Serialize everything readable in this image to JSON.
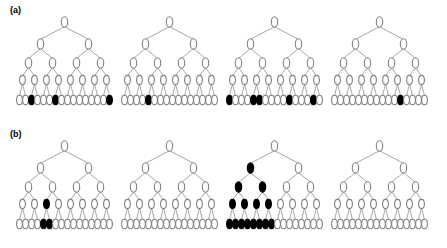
{
  "figure": {
    "title": "",
    "width": 447,
    "height": 248,
    "background": "#ffffff",
    "node_outline_color": "#808080",
    "node_fill_empty": "#ffffff",
    "node_fill_marked": "#000000",
    "edge_color": "#909090"
  },
  "panels": [
    {
      "label": "(a)",
      "id": "panel-a",
      "trees": [
        {
          "name": "tree-a-1",
          "levels": [
            1,
            2,
            4,
            8,
            16
          ],
          "marked": {
            "level0": [],
            "level1": [],
            "level2": [],
            "level3": [],
            "level4": [
              3,
              7,
              16
            ]
          }
        },
        {
          "name": "tree-a-2",
          "levels": [
            1,
            2,
            4,
            8,
            16
          ],
          "marked": {
            "level0": [],
            "level1": [],
            "level2": [],
            "level3": [],
            "level4": [
              5
            ]
          }
        },
        {
          "name": "tree-a-3",
          "levels": [
            1,
            2,
            4,
            8,
            16
          ],
          "marked": {
            "level0": [],
            "level1": [],
            "level2": [],
            "level3": [],
            "level4": [
              1,
              5,
              6,
              11,
              15
            ]
          }
        },
        {
          "name": "tree-a-4",
          "levels": [
            1,
            2,
            4,
            8,
            16
          ],
          "marked": {
            "level0": [],
            "level1": [],
            "level2": [],
            "level3": [],
            "level4": [
              12
            ]
          }
        }
      ]
    },
    {
      "label": "(b)",
      "id": "panel-b",
      "trees": [
        {
          "name": "tree-b-1",
          "levels": [
            1,
            2,
            4,
            8,
            16
          ],
          "marked": {
            "level0": [],
            "level1": [],
            "level2": [],
            "level3": [
              3
            ],
            "level4": [
              5,
              6
            ]
          }
        },
        {
          "name": "tree-b-2",
          "levels": [
            1,
            2,
            4,
            8,
            16
          ],
          "marked": {
            "level0": [],
            "level1": [],
            "level2": [],
            "level3": [],
            "level4": []
          }
        },
        {
          "name": "tree-b-3",
          "levels": [
            1,
            2,
            4,
            8,
            16
          ],
          "marked": {
            "level0": [],
            "level1": [
              1
            ],
            "level2": [
              1,
              2
            ],
            "level3": [
              1,
              2,
              3,
              4
            ],
            "level4": [
              1,
              2,
              3,
              4,
              5,
              6,
              7,
              8
            ]
          }
        },
        {
          "name": "tree-b-4",
          "levels": [
            1,
            2,
            4,
            8,
            16
          ],
          "marked": {
            "level0": [],
            "level1": [],
            "level2": [],
            "level3": [],
            "level4": []
          }
        }
      ]
    }
  ],
  "layout": {
    "tree_x_offsets": [
      12,
      117,
      222,
      327
    ],
    "level_y": [
      22,
      44,
      63,
      80,
      100
    ],
    "node_rx": [
      3.2,
      3.2,
      3.2,
      2.9,
      2.9
    ],
    "node_ry": [
      5.2,
      5.2,
      5.2,
      4.6,
      4.8
    ],
    "leaf_span": 96
  }
}
